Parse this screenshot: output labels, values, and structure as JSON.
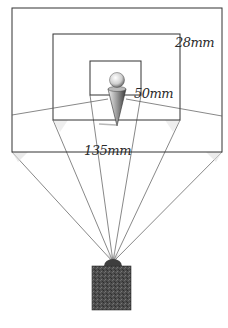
{
  "diagram": {
    "labels": {
      "wide": "28mm",
      "normal": "50mm",
      "tele": "135mm"
    },
    "frames": [
      {
        "name": "28mm-frame",
        "x": 12,
        "y": 8,
        "w": 210,
        "h": 144
      },
      {
        "name": "50mm-frame",
        "x": 53,
        "y": 34,
        "w": 127,
        "h": 86
      },
      {
        "name": "135mm-frame",
        "x": 90,
        "y": 61,
        "w": 51,
        "h": 34
      }
    ],
    "camera_position": {
      "x": 113,
      "y": 262
    },
    "colors": {
      "line": "#3a3a3a",
      "camera": "#4a4a4a",
      "background": "#ffffff"
    }
  }
}
